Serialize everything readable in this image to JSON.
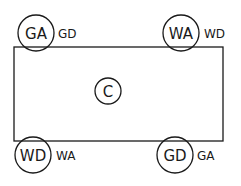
{
  "diagram": {
    "center": {
      "label": "C"
    },
    "corners": [
      {
        "id": "top-left",
        "circle_label": "GA",
        "side_label": "GD"
      },
      {
        "id": "top-right",
        "circle_label": "WA",
        "side_label": "WD"
      },
      {
        "id": "bottom-left",
        "circle_label": "WD",
        "side_label": "WA"
      },
      {
        "id": "bottom-right",
        "circle_label": "GD",
        "side_label": "GA"
      }
    ]
  }
}
